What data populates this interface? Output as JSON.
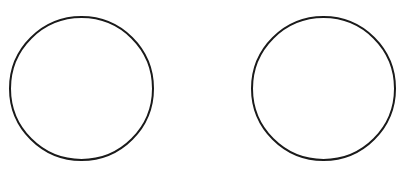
{
  "canvas": {
    "width": 404,
    "height": 175,
    "background": "#ffffff"
  },
  "shapes": [
    {
      "type": "circle",
      "cx": 81.5,
      "cy": 88.5,
      "r": 71.5,
      "stroke": "#1a1a1a",
      "stroke_width": 2,
      "fill": "none"
    },
    {
      "type": "circle",
      "cx": 323.5,
      "cy": 88.5,
      "r": 71.5,
      "stroke": "#1a1a1a",
      "stroke_width": 2,
      "fill": "none"
    }
  ]
}
